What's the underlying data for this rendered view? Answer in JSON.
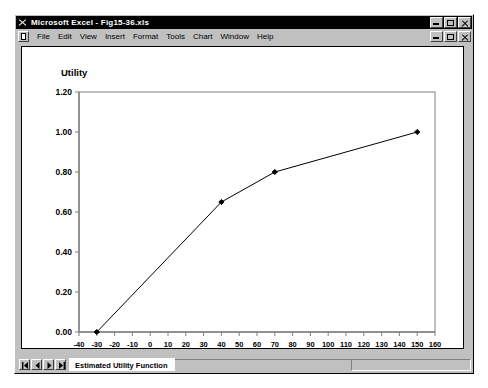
{
  "window": {
    "title": "Microsoft Excel - Fig15-36.xls",
    "app_icon": "excel-x-icon",
    "controls": [
      "minimize-button",
      "restore-button",
      "close-button"
    ]
  },
  "menubar": {
    "doc_icon": "document-icon",
    "items": [
      {
        "label": "File"
      },
      {
        "label": "Edit"
      },
      {
        "label": "View"
      },
      {
        "label": "Insert"
      },
      {
        "label": "Format"
      },
      {
        "label": "Tools"
      },
      {
        "label": "Chart"
      },
      {
        "label": "Window"
      },
      {
        "label": "Help"
      }
    ],
    "controls": [
      "minimize-button",
      "restore-button",
      "close-button"
    ]
  },
  "sheet_tabs": {
    "nav_first": "first-sheet-icon",
    "nav_prev": "prev-sheet-icon",
    "nav_next": "next-sheet-icon",
    "nav_last": "last-sheet-icon",
    "active_tab": "Estimated Utility Function"
  },
  "chart_data": {
    "type": "line",
    "title": "",
    "xlabel": "Payoff (in $1,000s)",
    "ylabel": "Utility",
    "xlim": [
      -40,
      160
    ],
    "ylim": [
      0.0,
      1.2
    ],
    "xticks": [
      -40,
      -30,
      -20,
      -10,
      0,
      10,
      20,
      30,
      40,
      50,
      60,
      70,
      80,
      90,
      100,
      110,
      120,
      130,
      140,
      150,
      160
    ],
    "xtick_labels": [
      "-40",
      "-30",
      "-20",
      "-10",
      "0",
      "10",
      "20",
      "30",
      "40",
      "50",
      "60",
      "70",
      "80",
      "90",
      "100",
      "110",
      "120",
      "130",
      "140",
      "150",
      "160"
    ],
    "yticks": [
      0.0,
      0.2,
      0.4,
      0.6,
      0.8,
      1.0,
      1.2
    ],
    "ytick_labels": [
      "0.00",
      "0.20",
      "0.40",
      "0.60",
      "0.80",
      "1.00",
      "1.20"
    ],
    "grid": false,
    "legend": false,
    "series": [
      {
        "name": "Estimated Utility Function",
        "marker": "diamond",
        "color": "#000000",
        "x": [
          -30,
          40,
          70,
          150
        ],
        "y": [
          0.0,
          0.65,
          0.8,
          1.0
        ]
      }
    ]
  },
  "colors": {
    "window_face": "#c0c0c0",
    "titlebar": "#000000",
    "plot_background": "#ffffff",
    "axis": "#808080",
    "series": "#000000"
  }
}
